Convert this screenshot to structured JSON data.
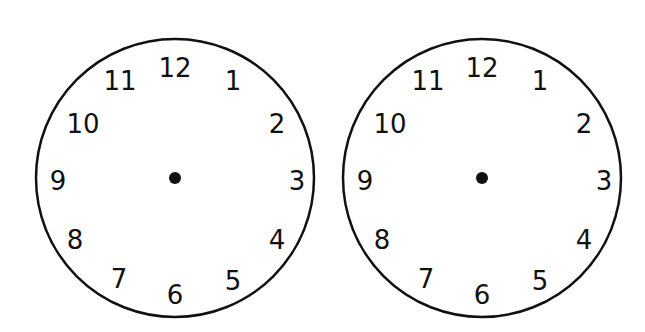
{
  "clocks": [
    {
      "id": "left",
      "center": [
        175,
        178
      ],
      "radius": 139,
      "numerals": {
        "12": {
          "label": "12",
          "x": 175,
          "y": 77
        },
        "1": {
          "label": "1",
          "x": 233,
          "y": 90
        },
        "2": {
          "label": "2",
          "x": 277,
          "y": 133
        },
        "3": {
          "label": "3",
          "x": 297,
          "y": 190
        },
        "4": {
          "label": "4",
          "x": 277,
          "y": 249
        },
        "5": {
          "label": "5",
          "x": 233,
          "y": 290
        },
        "6": {
          "label": "6",
          "x": 175,
          "y": 304
        },
        "7": {
          "label": "7",
          "x": 119,
          "y": 288
        },
        "8": {
          "label": "8",
          "x": 75,
          "y": 249
        },
        "9": {
          "label": "9",
          "x": 58,
          "y": 190
        },
        "10": {
          "label": "10",
          "x": 83,
          "y": 133
        },
        "11": {
          "label": "11",
          "x": 120,
          "y": 90
        }
      }
    },
    {
      "id": "right",
      "center": [
        482,
        178
      ],
      "radius": 139,
      "numerals": {
        "12": {
          "label": "12",
          "x": 482,
          "y": 77
        },
        "1": {
          "label": "1",
          "x": 540,
          "y": 90
        },
        "2": {
          "label": "2",
          "x": 584,
          "y": 133
        },
        "3": {
          "label": "3",
          "x": 604,
          "y": 190
        },
        "4": {
          "label": "4",
          "x": 584,
          "y": 249
        },
        "5": {
          "label": "5",
          "x": 540,
          "y": 290
        },
        "6": {
          "label": "6",
          "x": 482,
          "y": 304
        },
        "7": {
          "label": "7",
          "x": 426,
          "y": 288
        },
        "8": {
          "label": "8",
          "x": 382,
          "y": 249
        },
        "9": {
          "label": "9",
          "x": 365,
          "y": 190
        },
        "10": {
          "label": "10",
          "x": 390,
          "y": 133
        },
        "11": {
          "label": "11",
          "x": 428,
          "y": 90
        }
      }
    }
  ],
  "style": {
    "stroke_color": "#111111",
    "background": "#ffffff"
  }
}
